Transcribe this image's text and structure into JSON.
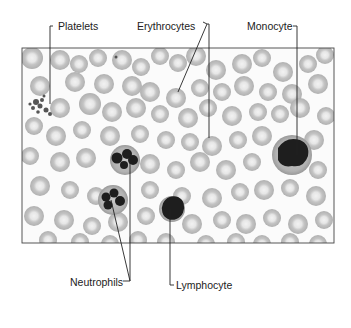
{
  "diagram": {
    "labels": {
      "platelets": "Platelets",
      "erythrocytes": "Erythrocytes",
      "monocyte": "Monocyte",
      "neutrophils": "Neutrophils",
      "lymphocyte": "Lymphocyte"
    },
    "colors": {
      "rbc_fill": "#c8c8c8",
      "rbc_center": "#efefef",
      "nucleus": "#1e1e1e",
      "wbc_cytoplasm": "#b4b4b4",
      "frame": "#444444",
      "leader_line": "#222222"
    }
  }
}
